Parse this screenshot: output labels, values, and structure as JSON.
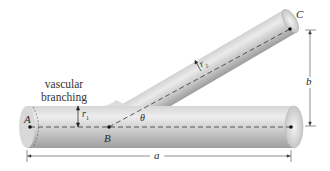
{
  "diagram": {
    "caption": {
      "line1": "vascular",
      "line2": "branching"
    },
    "points": {
      "A": "A",
      "B": "B",
      "C": "C"
    },
    "radii": {
      "r1_base": "r",
      "r1_sub": "1",
      "r2_base": "r",
      "r2_sub": "2"
    },
    "angle": "θ",
    "dimensions": {
      "horizontal": "a",
      "vertical": "b"
    },
    "colors": {
      "tube_light": "#e8e8e8",
      "tube_mid": "#c4c4c4",
      "tube_dark": "#9a9a9a",
      "line": "#333333"
    }
  }
}
